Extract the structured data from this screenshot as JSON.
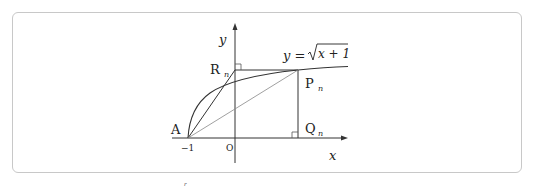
{
  "diagram": {
    "axis_labels": {
      "x": "x",
      "y": "y"
    },
    "origin_label": "O",
    "tick_labels": {
      "neg_one": "−1"
    },
    "curve_label": {
      "lhs": "y = ",
      "radicand": "x + 1"
    },
    "points": {
      "A": "A",
      "R": "R",
      "R_sub": "n",
      "P": "P",
      "P_sub": "n",
      "Q": "Q",
      "Q_sub": "n"
    },
    "stray_mark": "r"
  }
}
